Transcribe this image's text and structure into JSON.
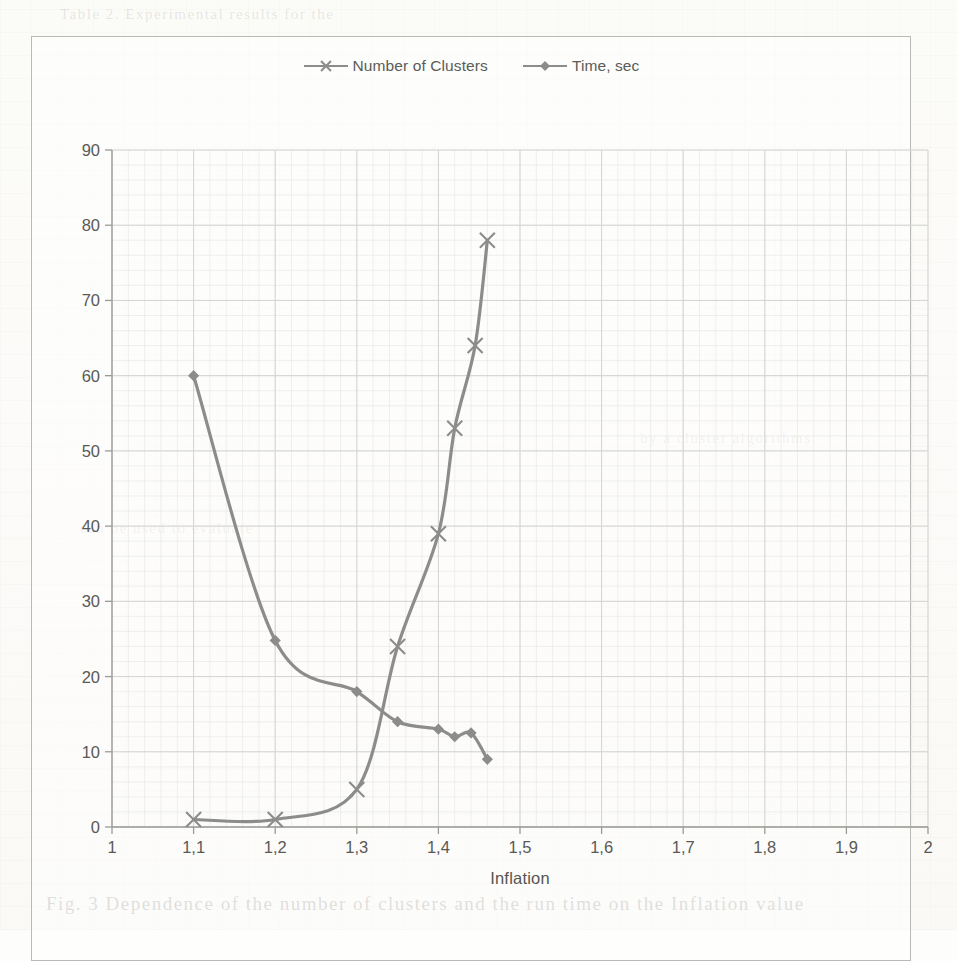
{
  "page": {
    "background_color": "#fdfdfb",
    "border_color": "#b9b9b5",
    "ghost_lines": [
      "Table 2. Experimental results for the",
      "by a cluster algorithms",
      "can be used to evaluate",
      "Fig. 3 Dependence of the number of clusters and the run time on the Inflation value"
    ]
  },
  "chart_data": {
    "type": "line",
    "title": "",
    "xlabel": "Inflation",
    "ylabel": "",
    "xlim": [
      1,
      2
    ],
    "ylim": [
      0,
      90
    ],
    "grid": true,
    "legend_position": "top",
    "xticks": [
      "1",
      "1,1",
      "1,2",
      "1,3",
      "1,4",
      "1,5",
      "1,6",
      "1,7",
      "1,8",
      "1,9",
      "2"
    ],
    "xtick_values": [
      1,
      1.1,
      1.2,
      1.3,
      1.4,
      1.5,
      1.6,
      1.7,
      1.8,
      1.9,
      2
    ],
    "yticks": [
      "0",
      "10",
      "20",
      "30",
      "40",
      "50",
      "60",
      "70",
      "80",
      "90"
    ],
    "ytick_values": [
      0,
      10,
      20,
      30,
      40,
      50,
      60,
      70,
      80,
      90
    ],
    "series": [
      {
        "name": "Number of Clusters",
        "marker": "x",
        "color": "#8c8c8a",
        "x": [
          1.1,
          1.2,
          1.3,
          1.35,
          1.4,
          1.42,
          1.445,
          1.46
        ],
        "values": [
          1,
          1,
          5,
          24,
          39,
          53,
          64,
          78
        ]
      },
      {
        "name": "Time, sec",
        "marker": "diamond",
        "color": "#8c8c8a",
        "x": [
          1.1,
          1.2,
          1.3,
          1.35,
          1.4,
          1.42,
          1.44,
          1.46
        ],
        "values": [
          60,
          24.8,
          18,
          14,
          13,
          12,
          12.5,
          9
        ]
      }
    ]
  },
  "legend": {
    "items": [
      {
        "label": "Number of Clusters",
        "marker": "x-marker-icon"
      },
      {
        "label": "Time, sec",
        "marker": "diamond-marker-icon"
      }
    ]
  },
  "axes": {
    "x_title": "Inflation"
  },
  "colors": {
    "series_line": "#8c8c8a",
    "grid_major": "#d4d4d2",
    "grid_minor": "#e6e6e4",
    "axis": "#9a9a97",
    "text": "#595956"
  }
}
